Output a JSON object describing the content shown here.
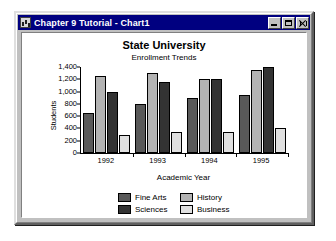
{
  "window": {
    "title": "Chapter 9 Tutorial - Chart1",
    "icon": "chart-document-icon",
    "buttons": {
      "minimize": "minimize",
      "maximize": "maximize",
      "close": "close"
    }
  },
  "colors": {
    "titlebar": "#000080",
    "window_face": "#c0c0c0",
    "sheet": "#ffffff",
    "fine_arts": "#595959",
    "history": "#b3b3b3",
    "sciences": "#333333",
    "business": "#e0e0e0"
  },
  "chart_data": {
    "type": "bar",
    "title": "State University",
    "subtitle": "Enrollment Trends",
    "xlabel": "Academic Year",
    "ylabel": "Students",
    "categories": [
      "1992",
      "1993",
      "1994",
      "1995"
    ],
    "yticks": [
      "0",
      "200",
      "400",
      "600",
      "800",
      "1,000",
      "1,200",
      "1,400"
    ],
    "ylim": [
      0,
      1400
    ],
    "grid": false,
    "legend_position": "bottom",
    "series": [
      {
        "name": "Fine Arts",
        "color": "#595959",
        "values": [
          650,
          800,
          900,
          950
        ]
      },
      {
        "name": "History",
        "color": "#b3b3b3",
        "values": [
          1250,
          1300,
          1200,
          1350
        ]
      },
      {
        "name": "Sciences",
        "color": "#333333",
        "values": [
          1000,
          1150,
          1200,
          1400
        ]
      },
      {
        "name": "Business",
        "color": "#e0e0e0",
        "values": [
          300,
          350,
          350,
          400
        ]
      }
    ]
  }
}
